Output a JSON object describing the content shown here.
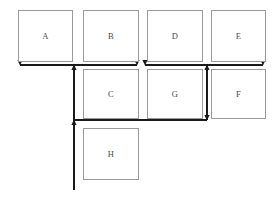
{
  "diagram": {
    "background_color": "#ffffff",
    "box_border_color": "#9a9a9a",
    "label_color": "#4a4a4a",
    "connector_color": "#1a1a1a",
    "nodes": [
      {
        "id": "A",
        "label": "A",
        "x": 18,
        "y": 10,
        "w": 55,
        "h": 52,
        "row": "top"
      },
      {
        "id": "B",
        "label": "B",
        "x": 83,
        "y": 10,
        "w": 56,
        "h": 52,
        "row": "top"
      },
      {
        "id": "D",
        "label": "D",
        "x": 147,
        "y": 10,
        "w": 56,
        "h": 52,
        "row": "top"
      },
      {
        "id": "E",
        "label": "E",
        "x": 211,
        "y": 10,
        "w": 55,
        "h": 52,
        "row": "top"
      },
      {
        "id": "C",
        "label": "C",
        "x": 83,
        "y": 69,
        "w": 56,
        "h": 50,
        "row": "middle"
      },
      {
        "id": "G",
        "label": "G",
        "x": 147,
        "y": 69,
        "w": 56,
        "h": 50,
        "row": "middle"
      },
      {
        "id": "F",
        "label": "F",
        "x": 211,
        "y": 69,
        "w": 55,
        "h": 50,
        "row": "middle"
      },
      {
        "id": "H",
        "label": "H",
        "x": 83,
        "y": 128,
        "w": 56,
        "h": 52,
        "row": "bottom"
      }
    ],
    "connectors": {
      "bus_top_y": 65,
      "bus_middle_y": 120,
      "vertical_left_x": 74,
      "vertical_left_bottom_y": 190,
      "vertical_right_x": 207,
      "segments": [
        {
          "name": "bus-segment-a-b",
          "x1": 20,
          "x2": 137,
          "y": 65
        },
        {
          "name": "bus-segment-d-e",
          "x1": 145,
          "x2": 263,
          "y": 65
        },
        {
          "name": "bus-segment-middle",
          "x1": 74,
          "x2": 207,
          "y": 120
        },
        {
          "name": "vertical-left-trunk",
          "x": 74,
          "y1": 65,
          "y2": 190
        },
        {
          "name": "vertical-right-link",
          "x": 207,
          "y1": 65,
          "y2": 120
        }
      ],
      "arrowheads": [
        {
          "name": "arrow-down-a",
          "x": 20,
          "y": 65,
          "dir": "down"
        },
        {
          "name": "arrow-down-b",
          "x": 137,
          "y": 65,
          "dir": "down"
        },
        {
          "name": "arrow-down-d",
          "x": 145,
          "y": 65,
          "dir": "down"
        },
        {
          "name": "arrow-down-e",
          "x": 263,
          "y": 65,
          "dir": "down"
        },
        {
          "name": "arrow-up-junction-left",
          "x": 74,
          "y": 65,
          "dir": "up"
        },
        {
          "name": "arrow-up-junction-right",
          "x": 207,
          "y": 65,
          "dir": "up"
        },
        {
          "name": "arrow-down-right-link",
          "x": 207,
          "y": 120,
          "dir": "down"
        },
        {
          "name": "arrow-up-junction-bottom",
          "x": 74,
          "y": 120,
          "dir": "up"
        }
      ]
    }
  }
}
